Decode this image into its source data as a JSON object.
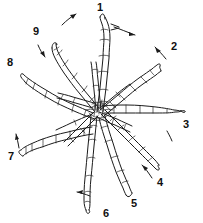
{
  "figure": {
    "kind": "line-art-diagram",
    "width": 203,
    "height": 223,
    "background_color": "#ffffff",
    "ink_color": "#1b1b1b",
    "center": {
      "x": 97,
      "y": 110
    },
    "labels": [
      {
        "id": "1",
        "text": "1",
        "x": 100,
        "y": 11
      },
      {
        "id": "2",
        "text": "2",
        "x": 174,
        "y": 50
      },
      {
        "id": "3",
        "text": "3",
        "x": 186,
        "y": 128
      },
      {
        "id": "4",
        "text": "4",
        "x": 160,
        "y": 186
      },
      {
        "id": "5",
        "text": "5",
        "x": 134,
        "y": 207
      },
      {
        "id": "6",
        "text": "6",
        "x": 106,
        "y": 217
      },
      {
        "id": "7",
        "text": "7",
        "x": 11,
        "y": 160
      },
      {
        "id": "8",
        "text": "8",
        "x": 10,
        "y": 66
      },
      {
        "id": "9",
        "text": "9",
        "x": 36,
        "y": 35
      }
    ],
    "pointer_arrows": [
      {
        "id": "arrow-1",
        "from": {
          "x": 113,
          "y": 28
        },
        "to": {
          "x": 135,
          "y": 34
        }
      },
      {
        "id": "arrow-1b",
        "from": {
          "x": 116,
          "y": 25
        },
        "to": {
          "x": 133,
          "y": 32
        }
      },
      {
        "id": "arrow-2",
        "from": {
          "x": 164,
          "y": 58
        },
        "to": {
          "x": 155,
          "y": 48
        }
      },
      {
        "id": "arrow-3",
        "from": {
          "x": 172,
          "y": 140
        },
        "to": {
          "x": 167,
          "y": 132
        }
      },
      {
        "id": "arrow-4",
        "from": {
          "x": 151,
          "y": 176
        },
        "to": {
          "x": 143,
          "y": 166
        }
      },
      {
        "id": "arrow-6",
        "from": {
          "x": 88,
          "y": 195
        },
        "to": {
          "x": 78,
          "y": 192
        }
      },
      {
        "id": "arrow-7",
        "from": {
          "x": 18,
          "y": 147
        },
        "to": {
          "x": 16,
          "y": 135
        }
      },
      {
        "id": "arrow-9",
        "from": {
          "x": 38,
          "y": 45
        },
        "to": {
          "x": 44,
          "y": 56
        }
      },
      {
        "id": "arrow-top",
        "from": {
          "x": 62,
          "y": 25
        },
        "to": {
          "x": 75,
          "y": 14
        }
      }
    ],
    "figure_count": 9,
    "spokes": [
      {
        "id": "spoke-1",
        "label": "1",
        "angle_deg": -90
      },
      {
        "id": "spoke-2",
        "label": "2",
        "angle_deg": -42
      },
      {
        "id": "spoke-3",
        "label": "3",
        "angle_deg": -2
      },
      {
        "id": "spoke-4",
        "label": "4",
        "angle_deg": 40
      },
      {
        "id": "spoke-5",
        "label": "5",
        "angle_deg": 68
      },
      {
        "id": "spoke-6",
        "label": "6",
        "angle_deg": 93
      },
      {
        "id": "spoke-7",
        "label": "7",
        "angle_deg": 168
      },
      {
        "id": "spoke-8",
        "label": "8",
        "angle_deg": -155
      },
      {
        "id": "spoke-9",
        "label": "9",
        "angle_deg": -118
      }
    ]
  }
}
